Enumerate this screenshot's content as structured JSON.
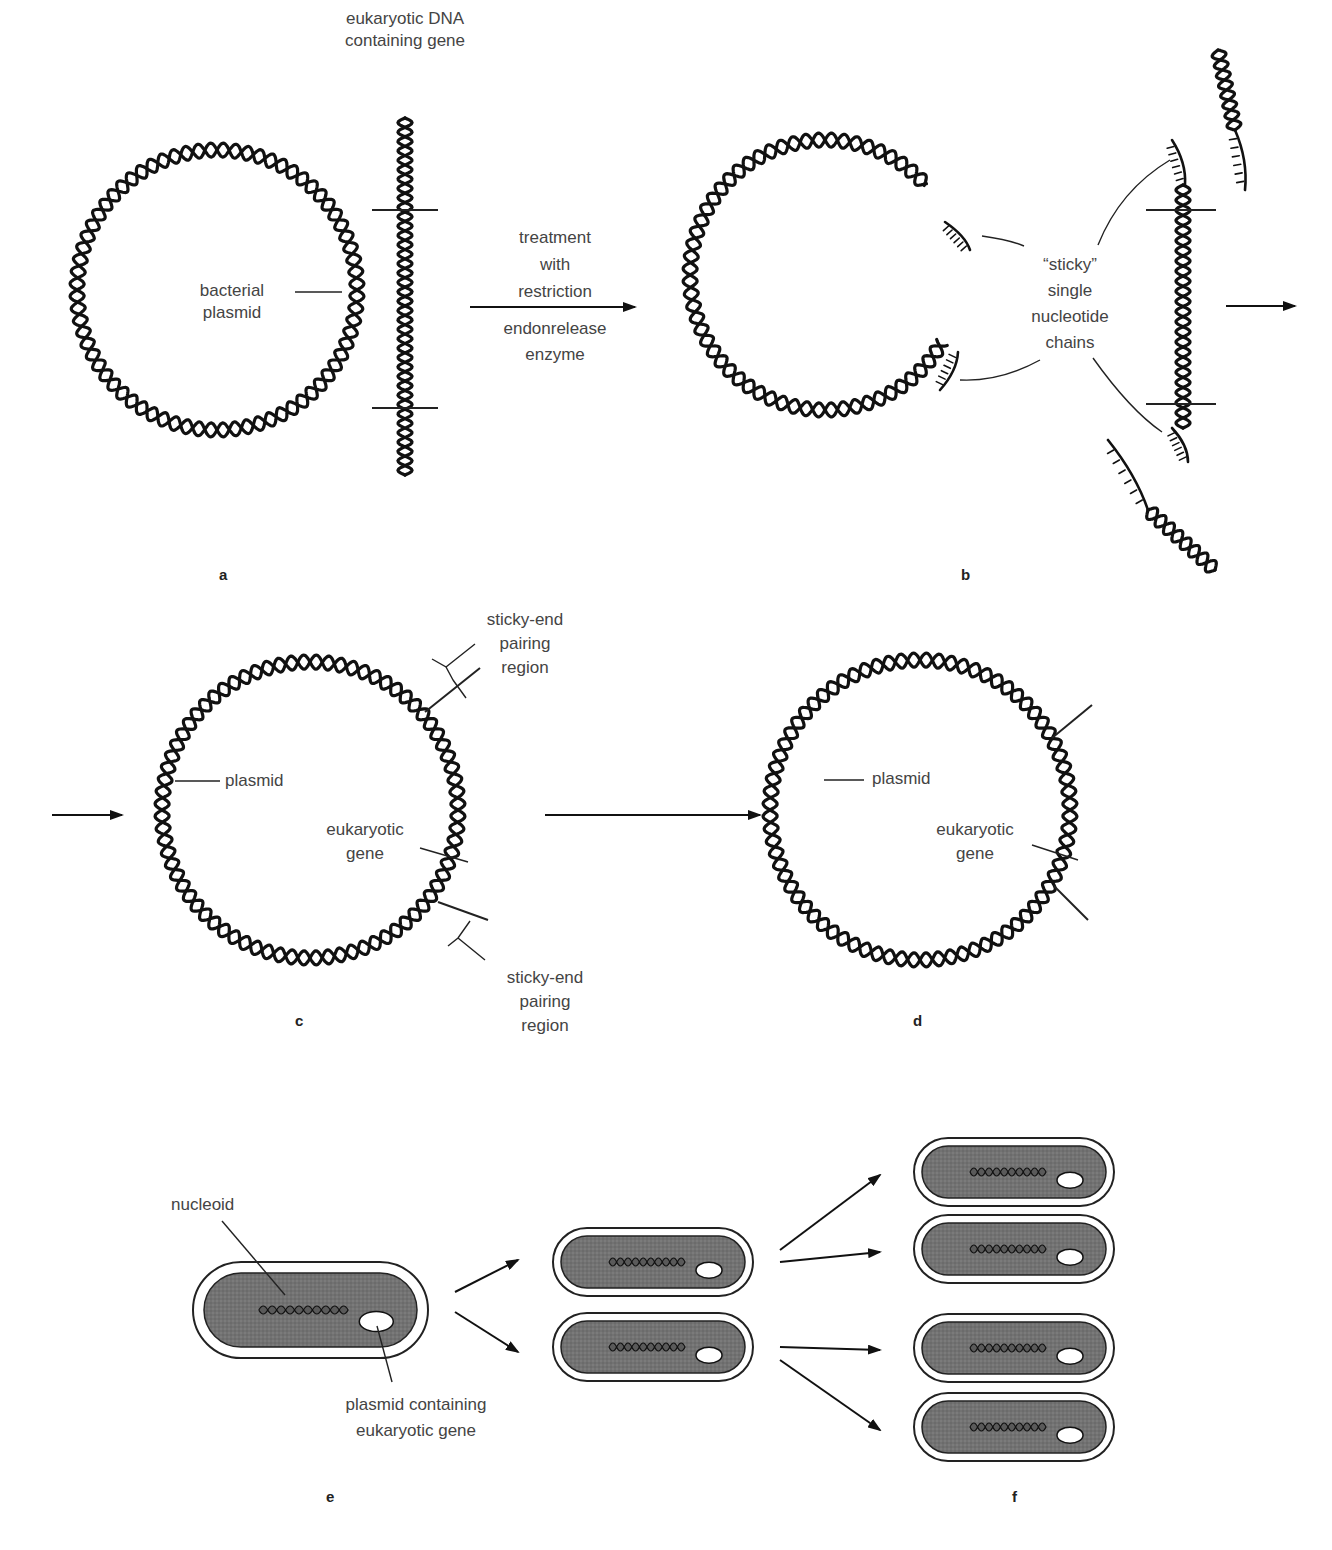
{
  "figure": {
    "colors": {
      "strand": "#111111",
      "cell_fill": "#6e6e6e",
      "cell_wall": "#ffffff",
      "outline": "#222222",
      "text": "#444444"
    },
    "panels": {
      "a": {
        "letter": "a",
        "label_dna": "eukaryotic DNA\ncontaining gene",
        "label_plasmid": "bacterial\nplasmid"
      },
      "arrow_ab": {
        "above": "treatment\nwith\nrestriction",
        "below": "endonrelease\nenzyme"
      },
      "b": {
        "letter": "b",
        "label_sticky": "“sticky”\nsingle\nnucleotide\nchains"
      },
      "c": {
        "letter": "c",
        "label_top": "sticky-end\npairing\nregion",
        "label_plasmid": "plasmid",
        "label_gene": "eukaryotic\ngene",
        "label_bottom": "sticky-end\npairing\nregion"
      },
      "d": {
        "letter": "d",
        "label_plasmid": "plasmid",
        "label_gene": "eukaryotic\ngene"
      },
      "e": {
        "letter": "e",
        "label_nucleoid": "nucleoid",
        "label_plasmid": "plasmid containing\neukaryotic gene"
      },
      "f": {
        "letter": "f"
      }
    },
    "geometry": {
      "circles": [
        {
          "id": "plasmid-a",
          "cx": 217,
          "cy": 290,
          "r": 140,
          "gap": null
        },
        {
          "id": "plasmid-b",
          "cx": 825,
          "cy": 275,
          "r": 135,
          "gap": [
            -42,
            30
          ]
        },
        {
          "id": "plasmid-c",
          "cx": 310,
          "cy": 810,
          "r": 148,
          "gap": null
        },
        {
          "id": "plasmid-d",
          "cx": 920,
          "cy": 810,
          "r": 150,
          "gap": null
        }
      ],
      "cells": [
        {
          "id": "cell-e",
          "x": 193,
          "y": 1262,
          "w": 235,
          "h": 96
        },
        {
          "id": "cell-e1",
          "x": 553,
          "y": 1228,
          "w": 200,
          "h": 68
        },
        {
          "id": "cell-e2",
          "x": 553,
          "y": 1313,
          "w": 200,
          "h": 68
        },
        {
          "id": "cell-f1",
          "x": 914,
          "y": 1138,
          "w": 200,
          "h": 68
        },
        {
          "id": "cell-f2",
          "x": 914,
          "y": 1215,
          "w": 200,
          "h": 68
        },
        {
          "id": "cell-f3",
          "x": 914,
          "y": 1314,
          "w": 200,
          "h": 68
        },
        {
          "id": "cell-f4",
          "x": 914,
          "y": 1393,
          "w": 200,
          "h": 68
        }
      ]
    }
  }
}
